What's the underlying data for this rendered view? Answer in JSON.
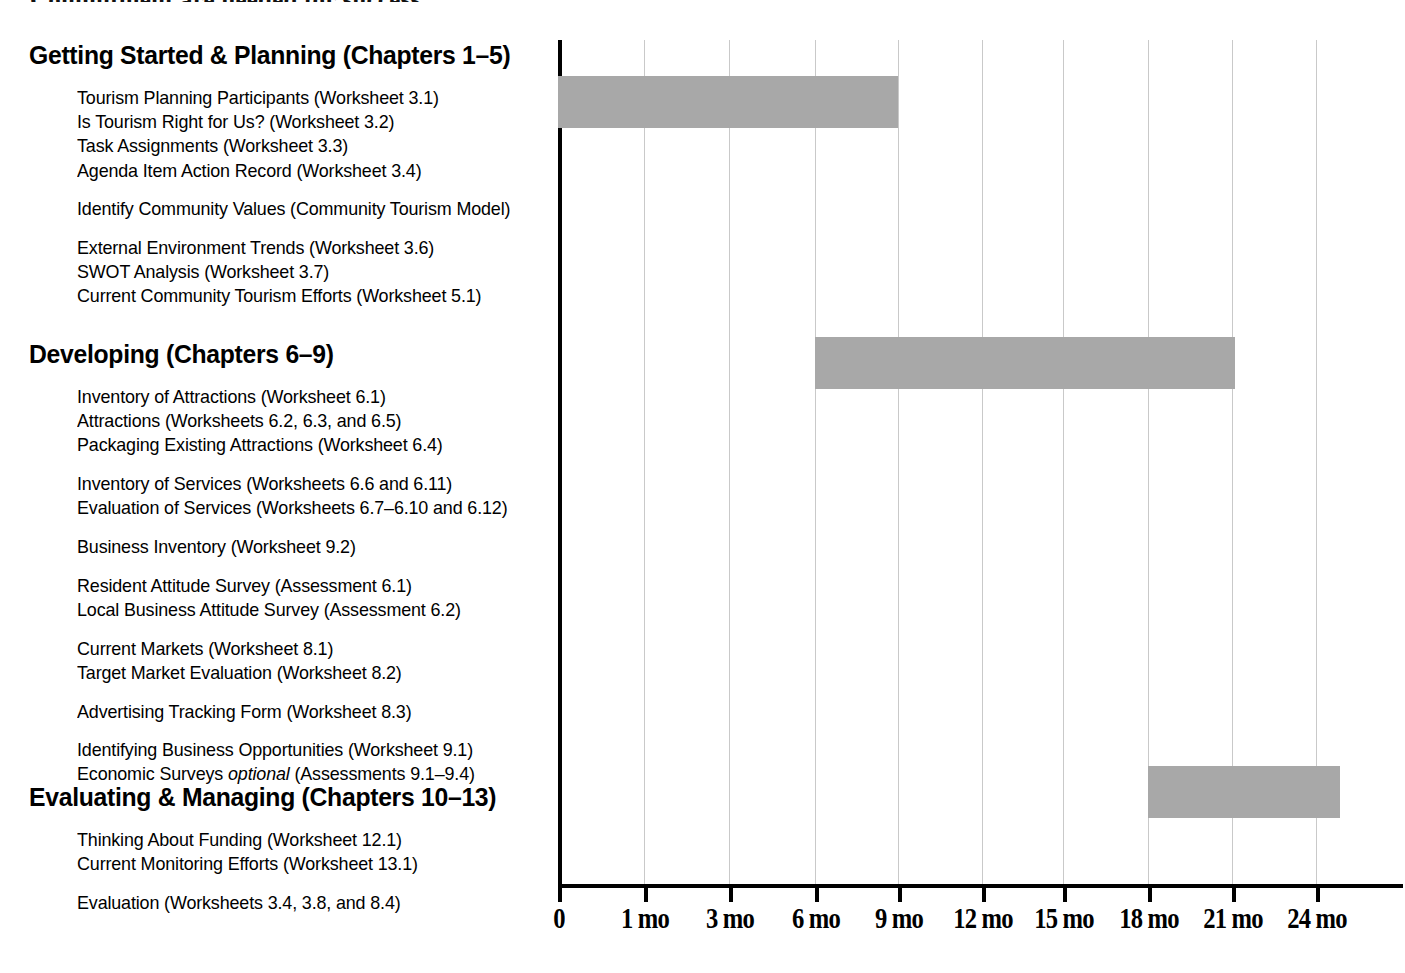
{
  "document": {
    "cut_off_heading": "Commitment are needed for success."
  },
  "sections": [
    {
      "heading": "Getting Started & Planning (Chapters 1–5)",
      "heading_top": 43,
      "groups": [
        {
          "items": [
            "Tourism Planning Participants (Worksheet 3.1)",
            "Is Tourism Right for Us? (Worksheet 3.2)",
            "Task Assignments (Worksheet 3.3)",
            "Agenda Item Action Record (Worksheet 3.4)"
          ]
        },
        {
          "items": [
            "Identify Community Values (Community Tourism Model)"
          ]
        },
        {
          "items": [
            "External Environment Trends (Worksheet 3.6)",
            "SWOT Analysis (Worksheet 3.7)",
            "Current Community Tourism Efforts (Worksheet 5.1)"
          ]
        }
      ]
    },
    {
      "heading": "Developing (Chapters 6–9)",
      "heading_top": 342,
      "groups": [
        {
          "items": [
            "Inventory of Attractions (Worksheet 6.1)",
            "Attractions (Worksheets 6.2, 6.3, and 6.5)",
            "Packaging Existing Attractions (Worksheet 6.4)"
          ]
        },
        {
          "items": [
            "Inventory of Services (Worksheets 6.6 and 6.11)",
            "Evaluation of Services (Worksheets 6.7–6.10 and 6.12)"
          ]
        },
        {
          "items": [
            "Business Inventory (Worksheet 9.2)"
          ]
        },
        {
          "items": [
            "Resident Attitude Survey (Assessment 6.1)",
            "Local Business Attitude Survey (Assessment 6.2)"
          ]
        },
        {
          "items": [
            "Current Markets (Worksheet 8.1)",
            "Target Market Evaluation (Worksheet 8.2)"
          ]
        },
        {
          "items": [
            "Advertising Tracking Form (Worksheet 8.3)"
          ]
        },
        {
          "items": [
            "Identifying Business Opportunities (Worksheet 9.1)",
            "Economic Surveys optional (Assessments 9.1–9.4)"
          ]
        }
      ]
    },
    {
      "heading": "Evaluating & Managing (Chapters 10–13)",
      "heading_top": 785,
      "groups": [
        {
          "items": [
            "Thinking About Funding (Worksheet 12.1)",
            "Current Monitoring Efforts (Worksheet 13.1)"
          ]
        },
        {
          "items": [
            "Evaluation (Worksheets 3.4, 3.8, and 8.4)"
          ]
        }
      ]
    }
  ],
  "chart_data": {
    "type": "bar",
    "orientation": "horizontal",
    "title": "",
    "xlabel": "",
    "ylabel": "",
    "xlim": [
      0,
      26
    ],
    "grid": true,
    "legend": "none",
    "bar_color": "#a8a8a8",
    "axis_color": "#000000",
    "gridline_color": "#c9c9c9",
    "tick_values": [
      0,
      1,
      3,
      6,
      9,
      12,
      15,
      18,
      21,
      24
    ],
    "tick_labels": [
      "0",
      "1 mo",
      "3 mo",
      "6 mo",
      "9 mo",
      "12 mo",
      "15 mo",
      "18 mo",
      "21 mo",
      "24 mo"
    ],
    "categories": [
      "Getting Started & Planning (Chapters 1–5)",
      "Developing (Chapters 6–9)",
      "Evaluating & Managing (Chapters 10–13)"
    ],
    "bars": [
      {
        "name": "Getting Started & Planning (Chapters 1–5)",
        "start_month": 0,
        "end_month": 9,
        "duration_months": 9,
        "px": {
          "left": 0,
          "width": 340,
          "top": 76,
          "height": 52
        }
      },
      {
        "name": "Developing (Chapters 6–9)",
        "start_month": 6,
        "end_month": 21,
        "duration_months": 15,
        "px": {
          "left": 257,
          "width": 420,
          "top": 337,
          "height": 52
        }
      },
      {
        "name": "Evaluating & Managing (Chapters 10–13)",
        "start_month": 18,
        "end_month": 25,
        "duration_months": 7,
        "px": {
          "left": 590,
          "width": 192,
          "top": 766,
          "height": 52
        }
      }
    ]
  },
  "axis_pixels": {
    "tick_x": [
      0,
      86,
      171,
      257,
      340,
      424,
      505,
      590,
      674,
      758
    ],
    "label_x": [
      0,
      86,
      171,
      257,
      340,
      424,
      505,
      590,
      674,
      758
    ]
  }
}
